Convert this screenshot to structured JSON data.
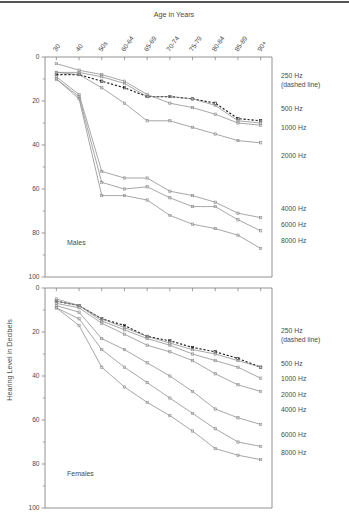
{
  "figure": {
    "x_axis_title": "Age in Years",
    "y_axis_title": "Hearing Level in Decibels",
    "panel_labels": {
      "top": "Males",
      "bottom": "Females"
    },
    "line_color": "#8a8a8a",
    "dashed_color": "#1a1a1a",
    "axis_color": "#777777",
    "categories": [
      "30",
      "40",
      "50s",
      "60-64",
      "65-69",
      "70-74",
      "75-79",
      "80-84",
      "85-89",
      "90+"
    ],
    "y_ticks_major": [
      "0",
      "20",
      "40",
      "60",
      "80",
      "100"
    ],
    "y_ticks_minor": [
      "10",
      "30",
      "50",
      "70",
      "90"
    ],
    "ylim": [
      0,
      100
    ],
    "y_inverted": true,
    "legend_entries": [
      {
        "label": "250 Hz",
        "sublabel": "(dashed line)"
      },
      {
        "label": "500 Hz",
        "sublabel": ""
      },
      {
        "label": "1000 Hz",
        "sublabel": ""
      },
      {
        "label": "2000 Hz",
        "sublabel": ""
      },
      {
        "label": "4000 Hz",
        "sublabel": ""
      },
      {
        "label": "6000 Hz",
        "sublabel": ""
      },
      {
        "label": "8000 Hz",
        "sublabel": ""
      }
    ]
  },
  "chart_data": [
    {
      "type": "line",
      "title": "Males",
      "xlabel": "Age in Years",
      "ylabel": "Hearing Level in Decibels",
      "ylim": [
        0,
        100
      ],
      "y_inverted": true,
      "grid": false,
      "legend_position": "right",
      "categories": [
        "30",
        "40",
        "50s",
        "60-64",
        "65-69",
        "70-74",
        "75-79",
        "80-84",
        "85-89",
        "90+"
      ],
      "series": [
        {
          "name": "250 Hz",
          "style": "dashed",
          "values": [
            8,
            8,
            11,
            14,
            18,
            18,
            19,
            21,
            28,
            29
          ]
        },
        {
          "name": "500 Hz",
          "style": "solid",
          "values": [
            7,
            7,
            9,
            12,
            18,
            18,
            19,
            22,
            29,
            30
          ]
        },
        {
          "name": "1000 Hz",
          "style": "solid",
          "values": [
            3,
            6,
            8,
            11,
            17,
            21,
            23,
            26,
            30,
            31
          ]
        },
        {
          "name": "2000 Hz",
          "style": "solid",
          "values": [
            7,
            8,
            14,
            21,
            29,
            29,
            32,
            35,
            38,
            39
          ]
        },
        {
          "name": "4000 Hz",
          "style": "solid",
          "values": [
            9,
            17,
            52,
            55,
            55,
            61,
            63,
            66,
            71,
            73
          ]
        },
        {
          "name": "6000 Hz",
          "style": "solid",
          "values": [
            10,
            18,
            57,
            60,
            59,
            64,
            68,
            68,
            74,
            79
          ]
        },
        {
          "name": "8000 Hz",
          "style": "solid",
          "values": [
            10,
            19,
            63,
            63,
            65,
            72,
            76,
            78,
            81,
            87
          ]
        }
      ]
    },
    {
      "type": "line",
      "title": "Females",
      "xlabel": "Age in Years",
      "ylabel": "Hearing Level in Decibels",
      "ylim": [
        0,
        100
      ],
      "y_inverted": true,
      "grid": false,
      "legend_position": "right",
      "categories": [
        "30",
        "40",
        "50s",
        "60-64",
        "65-69",
        "70-74",
        "75-79",
        "80-84",
        "85-89",
        "90+"
      ],
      "series": [
        {
          "name": "250 Hz",
          "style": "dashed",
          "values": [
            6,
            8,
            14,
            17,
            22,
            24,
            27,
            29,
            32,
            36
          ]
        },
        {
          "name": "500 Hz",
          "style": "solid",
          "values": [
            5,
            8,
            14,
            18,
            22,
            25,
            28,
            30,
            33,
            36
          ]
        },
        {
          "name": "1000 Hz",
          "style": "solid",
          "values": [
            6,
            8,
            15,
            19,
            23,
            26,
            30,
            33,
            36,
            41
          ]
        },
        {
          "name": "2000 Hz",
          "style": "solid",
          "values": [
            7,
            9,
            16,
            21,
            26,
            29,
            33,
            39,
            44,
            47
          ]
        },
        {
          "name": "4000 Hz",
          "style": "solid",
          "values": [
            8,
            11,
            23,
            28,
            34,
            40,
            47,
            55,
            59,
            62
          ]
        },
        {
          "name": "6000 Hz",
          "style": "solid",
          "values": [
            9,
            14,
            28,
            36,
            43,
            50,
            57,
            64,
            70,
            72
          ]
        },
        {
          "name": "8000 Hz",
          "style": "solid",
          "values": [
            9,
            17,
            36,
            45,
            52,
            58,
            65,
            73,
            76,
            78
          ]
        }
      ]
    }
  ]
}
